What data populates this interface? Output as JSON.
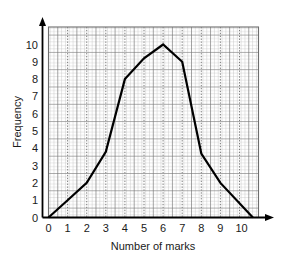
{
  "chart_data": {
    "type": "line",
    "title": "",
    "subtitle": "",
    "xlabel": "Number of marks",
    "ylabel": "Frequency",
    "xlim": [
      0,
      11
    ],
    "ylim": [
      0,
      10.7
    ],
    "xticks": [
      "0",
      "1",
      "2",
      "3",
      "4",
      "5",
      "6",
      "7",
      "8",
      "9",
      "10"
    ],
    "yticks": [
      "0",
      "1",
      "2",
      "3",
      "4",
      "5",
      "6",
      "7",
      "8",
      "9",
      "10"
    ],
    "grid": true,
    "grid_minor": true,
    "legend": "none",
    "series": [
      {
        "name": "Frequency polygon",
        "color": "#000000",
        "x": [
          0,
          1,
          2,
          3,
          4,
          5,
          6,
          7,
          8,
          9,
          10.7
        ],
        "values": [
          0,
          1,
          2,
          3.8,
          8,
          9.2,
          10,
          9,
          3.7,
          2,
          0
        ]
      }
    ],
    "annotations": []
  },
  "style": {
    "axis_color": "#000000",
    "grid_major_color": "#6b6b6b",
    "grid_minor_color": "#b8b8b8",
    "dotted_guide_color": "#8a8a8a",
    "line_color": "#000000",
    "background": "#ffffff",
    "text_color": "#1a1a1a"
  }
}
